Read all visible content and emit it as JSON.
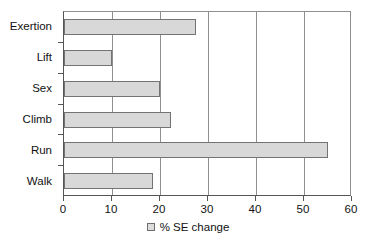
{
  "chart_data": {
    "type": "bar",
    "orientation": "horizontal",
    "title": "",
    "xlabel": "% SE change",
    "ylabel": "",
    "categories": [
      "Exertion",
      "Lift",
      "Sex",
      "Climb",
      "Run",
      "Walk"
    ],
    "values": [
      27.5,
      10,
      20,
      22.3,
      55,
      18.5
    ],
    "series": [
      {
        "name": "% SE change",
        "values": [
          27.5,
          10,
          20,
          22.3,
          55,
          18.5
        ]
      }
    ],
    "xlim": [
      0,
      60
    ],
    "xticks": [
      0,
      10,
      20,
      30,
      40,
      50,
      60
    ],
    "xtick_labels": [
      "0",
      "10",
      "20",
      "30",
      "40",
      "50",
      "60"
    ],
    "grid": "vertical",
    "legend": {
      "position": "bottom-center",
      "entries": [
        {
          "label": "% SE change",
          "color": "#dcdcdc"
        }
      ]
    },
    "colors": {
      "bar_fill": "#d8d8d8",
      "bar_border": "#737373",
      "gridline": "#8f8f8f",
      "axis": "#555555",
      "text": "#121212",
      "background": "#ffffff"
    }
  }
}
